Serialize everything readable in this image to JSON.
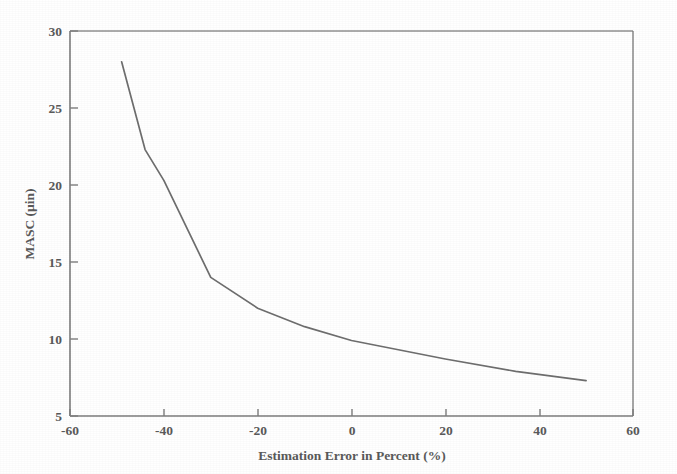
{
  "chart_data": {
    "type": "line",
    "title": "",
    "xlabel": "Estimation Error in Percent (%)",
    "ylabel": "MASC (µin)",
    "xlim": [
      -60,
      60
    ],
    "ylim": [
      5,
      30
    ],
    "xticks": [
      -60,
      -40,
      -20,
      0,
      20,
      40,
      60
    ],
    "xticklabels": [
      "-60",
      "-40",
      "-20",
      "0",
      "20",
      "40",
      "60"
    ],
    "yticks": [
      5,
      10,
      15,
      20,
      25,
      30
    ],
    "yticklabels": [
      "5",
      "10",
      "15",
      "20",
      "25",
      "30"
    ],
    "grid": false,
    "legend": "none",
    "series": [
      {
        "name": "MASC",
        "color": "#6e6e6e",
        "x": [
          -49,
          -44,
          -40,
          -30,
          -20,
          -10,
          0,
          10,
          20,
          35,
          50
        ],
        "values": [
          28.0,
          22.3,
          20.3,
          14.0,
          12.0,
          10.8,
          9.9,
          9.3,
          8.7,
          7.9,
          7.3
        ]
      }
    ]
  },
  "figure": {
    "background_color": "#ffffff",
    "axis_color": "#7d7d7d",
    "line_color": "#6e6e6e"
  }
}
